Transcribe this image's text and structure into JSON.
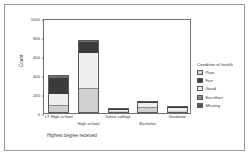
{
  "chart_data": {
    "type": "bar",
    "subtype": "stacked-bar",
    "title": "",
    "xlabel": "Highest degree received",
    "ylabel": "Count",
    "ylim": [
      0,
      1000
    ],
    "yticks": [
      0,
      200,
      400,
      600,
      800,
      1000
    ],
    "grid": false,
    "legend_position": "right",
    "legend_title": "Condition of health",
    "categories": [
      "LT High school",
      "High school",
      "Junior college",
      "Bachelor",
      "Graduate"
    ],
    "series": [
      {
        "name": "Poor",
        "color": "#d0d0d0",
        "values": [
          70,
          250,
          10,
          55,
          18
        ]
      },
      {
        "name": "Fair",
        "color": "#8a8a8a",
        "values": [
          10,
          12,
          4,
          8,
          4
        ]
      },
      {
        "name": "Good",
        "color": "#efefef",
        "values": [
          115,
          375,
          28,
          48,
          35
        ]
      },
      {
        "name": "Excellent",
        "color": "#3b3b3b",
        "values": [
          180,
          120,
          6,
          12,
          12
        ]
      },
      {
        "name": "Missing",
        "color": "#6e6e6e",
        "values": [
          25,
          15,
          2,
          5,
          3
        ]
      }
    ],
    "totals": [
      400,
      772,
      50,
      128,
      72
    ]
  },
  "axis": {
    "y_tick_labels": [
      "0",
      "200",
      "400",
      "600",
      "800",
      "1000"
    ],
    "y_title": "Count",
    "x_title": "Highest degree received"
  },
  "legend": {
    "title": "Condition of health",
    "items": [
      {
        "label": "Poor",
        "color": "#d0d0d0"
      },
      {
        "label": "Fair",
        "color": "#3b3b3b"
      },
      {
        "label": "Good",
        "color": "#efefef"
      },
      {
        "label": "Excellent",
        "color": "#8a8a8a"
      },
      {
        "label": "Missing",
        "color": "#555555"
      }
    ]
  }
}
